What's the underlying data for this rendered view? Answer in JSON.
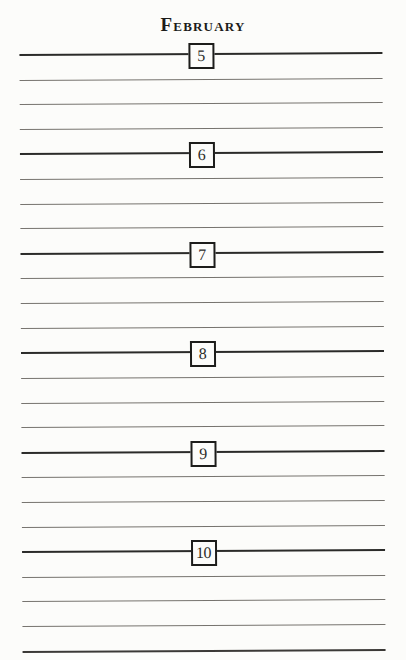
{
  "page": {
    "title": "February",
    "days": [
      {
        "label": "5"
      },
      {
        "label": "6"
      },
      {
        "label": "7"
      },
      {
        "label": "8"
      },
      {
        "label": "9"
      },
      {
        "label": "10"
      }
    ],
    "blank_lines_per_day": 3,
    "has_bottom_rule": true,
    "colors": {
      "paper": "#fcfcfa",
      "title_ink": "#1c1c1a",
      "day_line": "#2b2b29",
      "blank_line": "#76736e",
      "bottom_line": "#3b3936",
      "box_border": "#1d1d1b",
      "number_ink": "#2b2b28"
    }
  }
}
